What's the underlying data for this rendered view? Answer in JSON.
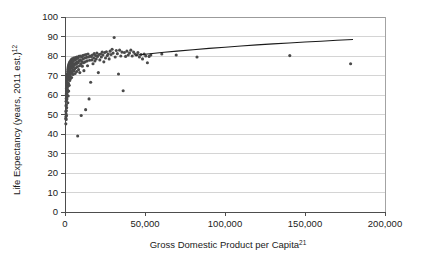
{
  "chart_data": {
    "type": "scatter",
    "title": "",
    "xlabel": "Gross Domestic Product per Capita",
    "xlabel_superscript": "21",
    "ylabel": "Life Expectancy (years, 2011 est.)",
    "ylabel_superscript": "12",
    "xlim": [
      0,
      200000
    ],
    "ylim": [
      0,
      100
    ],
    "xticks": [
      0,
      50000,
      100000,
      150000,
      200000
    ],
    "xtick_labels": [
      "0",
      "50,000",
      "100,000",
      "150,000",
      "200,000"
    ],
    "yticks": [
      0,
      10,
      20,
      30,
      40,
      50,
      60,
      70,
      80,
      90,
      100
    ],
    "ytick_labels": [
      "0",
      "10",
      "20",
      "30",
      "40",
      "50",
      "60",
      "70",
      "80",
      "90",
      "100"
    ],
    "grid": "horizontal",
    "legend": "none",
    "point_color": "#4a4a4a",
    "gridline_color": "#c9c9c9",
    "trendline_color": "#1a1a1a",
    "trendline": {
      "description": "logarithmic fit curve rising from about 80 years near 45,000 to about 88.5 years at 180,000",
      "points": [
        [
          44000,
          80.4
        ],
        [
          50000,
          80.9
        ],
        [
          56000,
          81.4
        ],
        [
          62000,
          81.9
        ],
        [
          70000,
          82.5
        ],
        [
          80000,
          83.2
        ],
        [
          90000,
          83.9
        ],
        [
          100000,
          84.5
        ],
        [
          110000,
          85.1
        ],
        [
          120000,
          85.7
        ],
        [
          130000,
          86.2
        ],
        [
          140000,
          86.7
        ],
        [
          150000,
          87.2
        ],
        [
          160000,
          87.6
        ],
        [
          170000,
          88.1
        ],
        [
          180000,
          88.5
        ]
      ]
    },
    "series": [
      {
        "name": "Countries",
        "points": [
          [
            480,
            48.0
          ],
          [
            520,
            45.2
          ],
          [
            560,
            51.5
          ],
          [
            600,
            49.0
          ],
          [
            640,
            54.5
          ],
          [
            680,
            50.2
          ],
          [
            700,
            56.8
          ],
          [
            720,
            47.5
          ],
          [
            760,
            58.2
          ],
          [
            790,
            52.0
          ],
          [
            820,
            60.5
          ],
          [
            850,
            55.0
          ],
          [
            880,
            62.0
          ],
          [
            900,
            57.5
          ],
          [
            930,
            49.5
          ],
          [
            960,
            63.5
          ],
          [
            990,
            59.0
          ],
          [
            1020,
            64.8
          ],
          [
            1050,
            53.5
          ],
          [
            1080,
            61.0
          ],
          [
            1100,
            66.0
          ],
          [
            1140,
            62.5
          ],
          [
            1180,
            67.2
          ],
          [
            1210,
            58.0
          ],
          [
            1250,
            64.0
          ],
          [
            1280,
            68.5
          ],
          [
            1310,
            60.0
          ],
          [
            1350,
            65.5
          ],
          [
            1390,
            69.5
          ],
          [
            1420,
            63.0
          ],
          [
            1460,
            70.2
          ],
          [
            1500,
            66.5
          ],
          [
            1540,
            71.0
          ],
          [
            1580,
            61.5
          ],
          [
            1620,
            67.8
          ],
          [
            1660,
            72.0
          ],
          [
            1700,
            68.5
          ],
          [
            1740,
            56.0
          ],
          [
            1780,
            73.0
          ],
          [
            1820,
            69.0
          ],
          [
            1860,
            64.5
          ],
          [
            1900,
            73.8
          ],
          [
            1950,
            70.0
          ],
          [
            2000,
            59.5
          ],
          [
            2050,
            74.5
          ],
          [
            2100,
            71.0
          ],
          [
            2150,
            66.0
          ],
          [
            2200,
            75.0
          ],
          [
            2250,
            72.0
          ],
          [
            2300,
            62.0
          ],
          [
            2350,
            75.5
          ],
          [
            2400,
            68.0
          ],
          [
            2450,
            73.0
          ],
          [
            2500,
            70.5
          ],
          [
            2560,
            76.0
          ],
          [
            2620,
            65.0
          ],
          [
            2680,
            74.0
          ],
          [
            2740,
            71.5
          ],
          [
            2800,
            76.5
          ],
          [
            2860,
            69.5
          ],
          [
            2920,
            73.5
          ],
          [
            2980,
            67.5
          ],
          [
            3050,
            77.0
          ],
          [
            3120,
            72.5
          ],
          [
            3190,
            75.0
          ],
          [
            3260,
            70.0
          ],
          [
            3330,
            76.8
          ],
          [
            3400,
            73.8
          ],
          [
            3480,
            68.5
          ],
          [
            3560,
            77.5
          ],
          [
            3640,
            74.5
          ],
          [
            3720,
            71.0
          ],
          [
            3800,
            76.0
          ],
          [
            3880,
            78.0
          ],
          [
            3960,
            72.0
          ],
          [
            4050,
            75.5
          ],
          [
            4140,
            69.0
          ],
          [
            4230,
            77.2
          ],
          [
            4320,
            74.0
          ],
          [
            4420,
            78.5
          ],
          [
            4520,
            71.5
          ],
          [
            4620,
            76.5
          ],
          [
            4720,
            73.0
          ],
          [
            4830,
            78.0
          ],
          [
            4940,
            75.0
          ],
          [
            5050,
            70.5
          ],
          [
            5160,
            77.5
          ],
          [
            5280,
            74.5
          ],
          [
            5400,
            79.0
          ],
          [
            5520,
            72.5
          ],
          [
            5650,
            76.0
          ],
          [
            5780,
            78.2
          ],
          [
            5910,
            75.5
          ],
          [
            6040,
            73.5
          ],
          [
            6180,
            77.8
          ],
          [
            6320,
            71.0
          ],
          [
            6460,
            79.2
          ],
          [
            6610,
            76.2
          ],
          [
            6760,
            74.0
          ],
          [
            6910,
            78.5
          ],
          [
            7070,
            75.8
          ],
          [
            7230,
            72.0
          ],
          [
            7400,
            79.5
          ],
          [
            7570,
            77.0
          ],
          [
            7740,
            74.5
          ],
          [
            7920,
            39.0
          ],
          [
            8100,
            78.8
          ],
          [
            8280,
            76.5
          ],
          [
            8470,
            73.0
          ],
          [
            8660,
            79.8
          ],
          [
            8860,
            77.5
          ],
          [
            9060,
            75.0
          ],
          [
            9260,
            71.5
          ],
          [
            9470,
            80.0
          ],
          [
            9680,
            78.0
          ],
          [
            9900,
            76.0
          ],
          [
            10120,
            49.5
          ],
          [
            10350,
            79.5
          ],
          [
            10580,
            77.2
          ],
          [
            10820,
            74.8
          ],
          [
            11060,
            80.2
          ],
          [
            11310,
            78.5
          ],
          [
            11560,
            76.5
          ],
          [
            11820,
            72.5
          ],
          [
            12080,
            80.5
          ],
          [
            12350,
            79.0
          ],
          [
            12620,
            77.0
          ],
          [
            12900,
            52.5
          ],
          [
            13190,
            80.8
          ],
          [
            13480,
            79.3
          ],
          [
            13780,
            77.5
          ],
          [
            14080,
            75.0
          ],
          [
            14390,
            81.0
          ],
          [
            14710,
            79.5
          ],
          [
            15030,
            58.0
          ],
          [
            15360,
            77.8
          ],
          [
            15700,
            80.0
          ],
          [
            16040,
            66.5
          ],
          [
            16390,
            79.8
          ],
          [
            16750,
            78.0
          ],
          [
            17120,
            80.5
          ],
          [
            17500,
            76.0
          ],
          [
            17890,
            79.0
          ],
          [
            18280,
            81.2
          ],
          [
            18680,
            77.5
          ],
          [
            19090,
            80.2
          ],
          [
            19510,
            78.5
          ],
          [
            19940,
            81.5
          ],
          [
            20380,
            79.8
          ],
          [
            20830,
            71.5
          ],
          [
            21290,
            80.8
          ],
          [
            21760,
            78.0
          ],
          [
            22240,
            81.0
          ],
          [
            22730,
            79.5
          ],
          [
            23230,
            82.0
          ],
          [
            23740,
            80.5
          ],
          [
            24260,
            77.0
          ],
          [
            24790,
            81.8
          ],
          [
            25330,
            79.0
          ],
          [
            25880,
            82.2
          ],
          [
            26440,
            80.2
          ],
          [
            27010,
            81.0
          ],
          [
            27600,
            78.5
          ],
          [
            28200,
            82.5
          ],
          [
            28810,
            80.8
          ],
          [
            29430,
            83.5
          ],
          [
            30070,
            81.5
          ],
          [
            30720,
            89.5
          ],
          [
            31380,
            79.5
          ],
          [
            32050,
            82.8
          ],
          [
            32730,
            81.2
          ],
          [
            33430,
            70.8
          ],
          [
            34140,
            83.0
          ],
          [
            34860,
            80.0
          ],
          [
            35600,
            82.0
          ],
          [
            36350,
            62.2
          ],
          [
            37110,
            81.8
          ],
          [
            37890,
            79.8
          ],
          [
            38680,
            82.5
          ],
          [
            39490,
            80.5
          ],
          [
            40310,
            81.5
          ],
          [
            41150,
            83.0
          ],
          [
            42000,
            80.0
          ],
          [
            42870,
            82.0
          ],
          [
            43760,
            81.0
          ],
          [
            44660,
            80.5
          ],
          [
            45580,
            81.8
          ],
          [
            46520,
            79.5
          ],
          [
            47480,
            80.8
          ],
          [
            48450,
            78.5
          ],
          [
            49450,
            81.0
          ],
          [
            50460,
            80.0
          ],
          [
            51500,
            76.5
          ],
          [
            52560,
            79.8
          ],
          [
            53640,
            80.5
          ],
          [
            60500,
            81.0
          ],
          [
            69500,
            80.5
          ],
          [
            82500,
            79.5
          ],
          [
            140500,
            80.2
          ],
          [
            178500,
            76.0
          ]
        ]
      }
    ]
  }
}
